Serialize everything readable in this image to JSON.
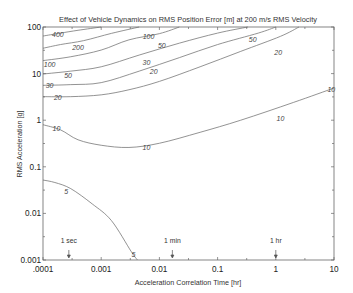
{
  "chart_data": {
    "type": "line",
    "subtype": "contour",
    "title": "Effect of Vehicle Dynamics on RMS Position Error [m] at 200 m/s RMS Velocity",
    "xlabel": "Acceleration Correlation Time [hr]",
    "ylabel": "RMS Acceleration [g]",
    "xscale": "log",
    "yscale": "log",
    "xlim": [
      0.0001,
      10
    ],
    "ylim": [
      0.001,
      100
    ],
    "xticks": [
      ".0001",
      "0.001",
      "0.01",
      "0.1",
      "1",
      "10"
    ],
    "yticks": [
      "0.001",
      "0.01",
      "0.1",
      "1",
      "10",
      "100"
    ],
    "grid": false,
    "legend": null,
    "annotations": [
      {
        "text": "1 sec",
        "x": 0.000278
      },
      {
        "text": "1 min",
        "x": 0.0167
      },
      {
        "text": "1 hr",
        "x": 1
      }
    ],
    "series": [
      {
        "name": "400",
        "label_pos": [
          0.00018,
          68
        ],
        "points": [
          [
            0.0001,
            64
          ],
          [
            0.0002,
            74
          ],
          [
            0.0004,
            85
          ],
          [
            0.001,
            100
          ]
        ]
      },
      {
        "name": "200",
        "label_pos": [
          0.0004,
          36
        ],
        "points": [
          [
            0.0001,
            35
          ],
          [
            0.0002,
            42
          ],
          [
            0.0005,
            51
          ],
          [
            0.0015,
            73
          ],
          [
            0.0045,
            100
          ]
        ]
      },
      {
        "name": "100",
        "label_pos": [
          0.00013,
          16
        ],
        "label_pos2": [
          0.0065,
          62
        ],
        "points": [
          [
            0.0001,
            19
          ],
          [
            0.0003,
            23
          ],
          [
            0.001,
            32
          ],
          [
            0.003,
            53
          ],
          [
            0.01,
            72
          ],
          [
            0.022,
            100
          ]
        ]
      },
      {
        "name": "50",
        "label_pos": [
          0.00027,
          9
        ],
        "label_pos2": [
          0.011,
          40
        ],
        "label_pos3": [
          0.4,
          55
        ],
        "points": [
          [
            0.0001,
            9.8
          ],
          [
            0.0003,
            11.3
          ],
          [
            0.001,
            14
          ],
          [
            0.0045,
            25
          ],
          [
            0.022,
            45
          ],
          [
            0.1,
            74
          ],
          [
            0.33,
            100
          ]
        ]
      },
      {
        "name": "30",
        "label_pos": [
          0.00013,
          5.6
        ],
        "label_pos2": [
          0.006,
          17
        ],
        "points": [
          [
            0.0001,
            5.6
          ],
          [
            0.0003,
            5.8
          ],
          [
            0.001,
            6.4
          ],
          [
            0.0045,
            11.3
          ],
          [
            0.022,
            22
          ],
          [
            0.1,
            42
          ],
          [
            0.5,
            74
          ],
          [
            1.0,
            100
          ]
        ]
      },
      {
        "name": "20",
        "label_pos": [
          0.00018,
          3.0
        ],
        "label_pos2": [
          0.008,
          11
        ],
        "label_pos3": [
          1.1,
          28
        ],
        "points": [
          [
            0.0001,
            3.2
          ],
          [
            0.0003,
            3.2
          ],
          [
            0.001,
            3.5
          ],
          [
            0.003,
            4.5
          ],
          [
            0.01,
            6.8
          ],
          [
            0.05,
            14
          ],
          [
            0.25,
            30
          ],
          [
            1.2,
            63
          ],
          [
            2.5,
            100
          ]
        ]
      },
      {
        "name": "10",
        "label_pos": [
          0.00017,
          0.66
        ],
        "label_pos2": [
          0.006,
          0.26
        ],
        "label_pos3": [
          1.2,
          1.1
        ],
        "label_pos4": [
          9,
          4.5
        ],
        "points": [
          [
            0.0001,
            0.8
          ],
          [
            0.0002,
            0.62
          ],
          [
            0.0004,
            0.38
          ],
          [
            0.001,
            0.29
          ],
          [
            0.003,
            0.26
          ],
          [
            0.01,
            0.32
          ],
          [
            0.05,
            0.55
          ],
          [
            0.25,
            1.0
          ],
          [
            2,
            2.4
          ],
          [
            10,
            4.9
          ]
        ]
      },
      {
        "name": "5",
        "label_pos": [
          0.00025,
          0.03
        ],
        "label_pos2": [
          0.0036,
          0.0013
        ],
        "points": [
          [
            0.0001,
            0.052
          ],
          [
            0.00016,
            0.046
          ],
          [
            0.0003,
            0.034
          ],
          [
            0.0007,
            0.016
          ],
          [
            0.0015,
            0.007
          ],
          [
            0.0033,
            0.0015
          ],
          [
            0.0042,
            0.001
          ]
        ]
      }
    ]
  },
  "plot": {
    "title": "Effect of Vehicle Dynamics on RMS Position Error [m] at 200 m/s RMS Velocity",
    "xlabel": "Acceleration Correlation Time [hr]",
    "ylabel": "RMS Acceleration [g]"
  }
}
